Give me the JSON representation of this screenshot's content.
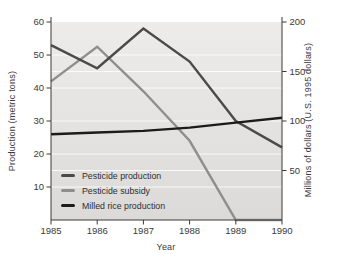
{
  "chart_data": {
    "type": "line",
    "x": [
      1985,
      1986,
      1987,
      1988,
      1989,
      1990
    ],
    "xlabel": "Year",
    "left_axis": {
      "label": "Production (metric tons)",
      "ticks": [
        10,
        20,
        30,
        40,
        50,
        60
      ],
      "range": [
        0,
        60
      ]
    },
    "right_axis": {
      "label": "Millions of dollars (U.S. 1995 dollars)",
      "ticks": [
        50,
        100,
        150,
        200
      ],
      "range": [
        0,
        200
      ]
    },
    "series": [
      {
        "name": "Pesticide production",
        "axis": "left",
        "color": "#4a4a4a",
        "values": [
          53,
          46,
          58,
          48,
          30,
          22
        ]
      },
      {
        "name": "Pesticide subsidy",
        "axis": "right",
        "color": "#8e8e8e",
        "values": [
          140,
          175,
          130,
          80,
          0,
          0
        ]
      },
      {
        "name": "Milled rice production",
        "axis": "left",
        "color": "#1b1b1b",
        "values": [
          26,
          26.5,
          27,
          28,
          29.5,
          31
        ]
      }
    ],
    "legend_position": "bottom-left-inside",
    "grid": true,
    "plot_bg_top": "#edecea",
    "plot_bg_bottom": "#dbdad8",
    "grid_color": "#ffffff",
    "axis_color": "#3a3a3a"
  }
}
